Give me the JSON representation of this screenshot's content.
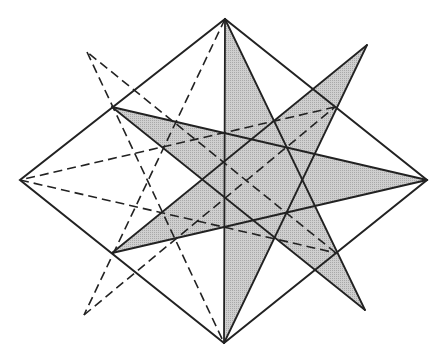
{
  "diagram": {
    "title": "",
    "colors": {
      "background": "#ffffff",
      "stroke": "#222222",
      "fill": "#c8c8c8"
    },
    "points": {
      "top": [
        225,
        19
      ],
      "bottom": [
        224,
        343
      ],
      "left": [
        20,
        180
      ],
      "right": [
        427,
        180
      ],
      "ul": [
        112,
        107
      ],
      "ll": [
        112,
        253
      ],
      "ur": [
        335,
        107
      ],
      "lr": [
        336,
        253
      ],
      "solid_ur_tip": [
        367,
        45
      ],
      "solid_lr_tip": [
        365,
        310
      ],
      "dashed_ul_tip": [
        87,
        52
      ],
      "dashed_ll_tip": [
        84,
        315
      ]
    },
    "outer_diamond": [
      "top",
      "right",
      "bottom",
      "left"
    ],
    "shaded_star": {
      "type": "{7/3} star polygon",
      "order": [
        "top",
        "solid_lr_tip",
        "ul",
        "right",
        "ll",
        "solid_ur_tip",
        "bottom"
      ]
    },
    "dashed_star": {
      "type": "{7/3} star polygon",
      "order": [
        "top",
        "dashed_ll_tip",
        "ur",
        "left",
        "lr",
        "dashed_ul_tip",
        "bottom"
      ]
    },
    "shared_edge": [
      "top",
      "bottom"
    ]
  }
}
